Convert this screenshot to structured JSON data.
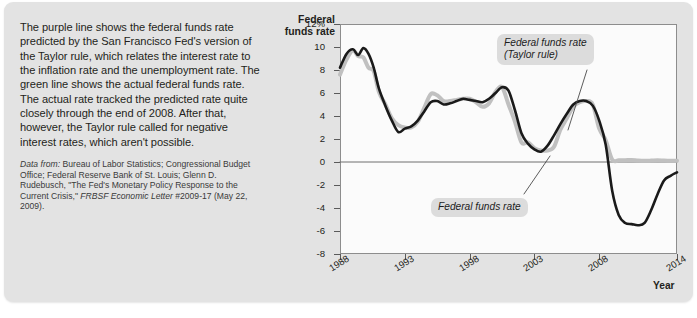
{
  "caption": {
    "body": "The purple line shows the federal funds rate predicted by the San Francisco Fed's version of the Taylor rule, which relates the interest rate to the inflation rate and the unemployment rate. The green line shows the actual federal funds rate. The actual rate tracked the predicted rate quite closely through the end of 2008. After that, however, the Taylor rule called for negative interest rates, which aren't possible.",
    "source_prefix": "Data from:",
    "source_rest": " Bureau of Labor Statistics; Congressional Budget Office; Federal Reserve Bank of St. Louis; Glenn D. Rudebusch, \"The Fed's Monetary Policy Response to the Current Crisis,\" ",
    "source_italic": "FRBSF Economic Letter",
    "source_tail": " #2009-17 (May 22, 2009)."
  },
  "chart_data": {
    "type": "line",
    "title": "",
    "ylabel": "Federal funds rate",
    "xlabel": "Year",
    "ylim": [
      -8,
      12
    ],
    "xlim": [
      1988,
      2014
    ],
    "grid": false,
    "zero_line": true,
    "ytick_labels": [
      "12%",
      "10",
      "8",
      "6",
      "4",
      "2",
      "0",
      "-2",
      "-4",
      "-6",
      "-8"
    ],
    "ytick_values": [
      12,
      10,
      8,
      6,
      4,
      2,
      0,
      -2,
      -4,
      -6,
      -8
    ],
    "xtick_labels": [
      "1988",
      "1993",
      "1998",
      "2003",
      "2008",
      "2014"
    ],
    "xtick_values": [
      1988,
      1993,
      1998,
      2003,
      2008,
      2014
    ],
    "annotations": [
      {
        "name": "taylor-rule-callout",
        "text_line1": "Federal funds rate",
        "text_line2": "(Taylor rule)"
      },
      {
        "name": "actual-rate-callout",
        "text_line1": "Federal funds rate",
        "text_line2": ""
      }
    ],
    "series": [
      {
        "name": "Federal funds rate (Taylor rule)",
        "color": "#1a1a1a",
        "width": 2.6,
        "x": [
          1988.0,
          1988.5,
          1989.0,
          1989.4,
          1989.8,
          1990.2,
          1990.6,
          1991.0,
          1991.5,
          1992.0,
          1992.5,
          1993.0,
          1993.5,
          1994.0,
          1994.5,
          1995.0,
          1995.5,
          1996.0,
          1996.5,
          1997.0,
          1997.5,
          1998.0,
          1998.5,
          1999.0,
          1999.5,
          2000.0,
          2000.5,
          2001.0,
          2001.5,
          2002.0,
          2002.5,
          2003.0,
          2003.5,
          2004.0,
          2004.5,
          2005.0,
          2005.5,
          2006.0,
          2006.5,
          2007.0,
          2007.5,
          2008.0,
          2008.5,
          2009.0,
          2009.5,
          2010.0,
          2010.5,
          2011.0,
          2011.5,
          2012.0,
          2012.5,
          2013.0,
          2013.5,
          2014.0
        ],
        "y": [
          8.2,
          9.4,
          9.8,
          9.3,
          9.9,
          9.4,
          8.2,
          6.4,
          4.9,
          3.6,
          2.6,
          2.9,
          3.1,
          3.6,
          4.4,
          5.2,
          5.3,
          5.0,
          5.1,
          5.3,
          5.5,
          5.4,
          5.3,
          5.2,
          5.5,
          6.0,
          6.5,
          6.2,
          4.5,
          2.5,
          1.6,
          1.1,
          0.9,
          1.4,
          2.3,
          3.3,
          4.2,
          5.0,
          5.3,
          5.3,
          4.9,
          3.6,
          1.5,
          -2.5,
          -4.6,
          -5.3,
          -5.4,
          -5.5,
          -5.3,
          -4.2,
          -2.8,
          -1.6,
          -1.2,
          -0.9
        ]
      },
      {
        "name": "Federal funds rate",
        "color": "#c0c0c0",
        "width": 4.0,
        "x": [
          1988.0,
          1988.5,
          1989.0,
          1989.4,
          1989.8,
          1990.2,
          1990.6,
          1991.0,
          1991.5,
          1992.0,
          1992.5,
          1993.0,
          1993.5,
          1994.0,
          1994.5,
          1995.0,
          1995.5,
          1996.0,
          1996.5,
          1997.0,
          1997.5,
          1998.0,
          1998.5,
          1999.0,
          1999.5,
          2000.0,
          2000.5,
          2001.0,
          2001.5,
          2002.0,
          2002.5,
          2003.0,
          2003.5,
          2004.0,
          2004.5,
          2005.0,
          2005.5,
          2006.0,
          2006.5,
          2007.0,
          2007.5,
          2008.0,
          2008.5,
          2009.0,
          2009.5,
          2010.0,
          2010.5,
          2011.0,
          2011.5,
          2012.0,
          2012.5,
          2013.0,
          2013.5,
          2014.0
        ],
        "y": [
          7.6,
          8.9,
          9.7,
          9.2,
          9.1,
          8.2,
          7.9,
          6.1,
          5.0,
          3.8,
          3.2,
          3.0,
          3.0,
          3.5,
          4.7,
          5.9,
          5.8,
          5.3,
          5.3,
          5.4,
          5.5,
          5.5,
          5.2,
          4.8,
          5.1,
          6.1,
          6.5,
          5.0,
          3.5,
          1.7,
          1.7,
          1.2,
          1.0,
          1.0,
          1.3,
          2.8,
          3.8,
          4.8,
          5.2,
          5.3,
          5.0,
          2.9,
          1.9,
          0.2,
          0.15,
          0.15,
          0.18,
          0.12,
          0.1,
          0.12,
          0.15,
          0.12,
          0.1,
          0.1
        ]
      }
    ]
  }
}
